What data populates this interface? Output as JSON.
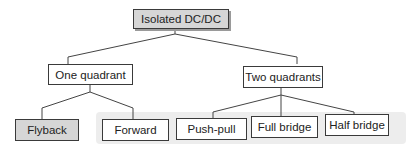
{
  "diagram": {
    "root": {
      "label": "Isolated DC/DC"
    },
    "branches": [
      {
        "label": "One quadrant",
        "children": [
          {
            "label": "Flyback"
          },
          {
            "label": "Forward"
          }
        ]
      },
      {
        "label": "Two quadrants",
        "children": [
          {
            "label": "Push-pull"
          },
          {
            "label": "Full bridge"
          },
          {
            "label": "Half bridge"
          }
        ]
      }
    ],
    "colors": {
      "box_border": "#3a3a3a",
      "shaded_box": "#d6d6d6",
      "background_band": "#ededed",
      "line": "#444444"
    }
  }
}
